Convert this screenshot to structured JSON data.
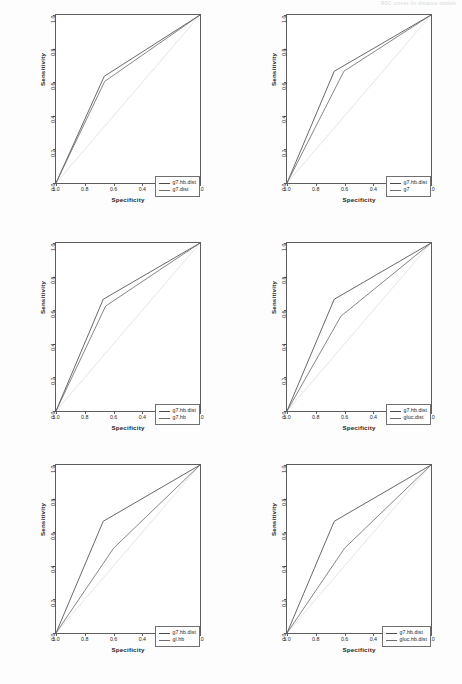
{
  "header": {
    "note": "ROC curves for distance models"
  },
  "axes": {
    "xlabel": "Specificity",
    "ylabel": "Sensitivity",
    "xticks": [
      "1.0",
      "0.8",
      "0.6",
      "0.4",
      "0.2",
      "0.0"
    ],
    "yticks": [
      "0.0",
      "0.2",
      "0.4",
      "0.6",
      "0.8",
      "1.0"
    ]
  },
  "colors": {
    "series_primary": "#4a4a4a",
    "series_secondary": "#6e6e6e",
    "diagonal": "#e2e2e2",
    "axis": "#5d5d5d",
    "legend_border": "#707070",
    "background": "#ffffff"
  },
  "chart_data": [
    {
      "type": "line",
      "panel": "top-left",
      "title": "",
      "xlabel": "Specificity",
      "ylabel": "Sensitivity",
      "xlim": [
        1.0,
        0.0
      ],
      "ylim": [
        0.0,
        1.0
      ],
      "x_reversed": true,
      "grid": false,
      "legend_position": "bottom-right",
      "diagonal_reference": true,
      "series": [
        {
          "name": "g7.hb.dist",
          "points": [
            [
              1.0,
              0.0
            ],
            [
              0.665,
              0.635
            ],
            [
              0.0,
              1.0
            ]
          ]
        },
        {
          "name": "g7.dist",
          "points": [
            [
              1.0,
              0.0
            ],
            [
              0.662,
              0.605
            ],
            [
              0.0,
              1.0
            ]
          ]
        }
      ]
    },
    {
      "type": "line",
      "panel": "top-right",
      "title": "",
      "xlabel": "Specificity",
      "ylabel": "Sensitivity",
      "xlim": [
        1.0,
        0.0
      ],
      "ylim": [
        0.0,
        1.0
      ],
      "x_reversed": true,
      "grid": false,
      "legend_position": "bottom-right",
      "diagonal_reference": true,
      "series": [
        {
          "name": "g7.hb.dist",
          "points": [
            [
              1.0,
              0.0
            ],
            [
              0.672,
              0.665
            ],
            [
              0.0,
              1.0
            ]
          ]
        },
        {
          "name": "g7",
          "points": [
            [
              1.0,
              0.0
            ],
            [
              0.605,
              0.665
            ],
            [
              0.0,
              1.0
            ]
          ]
        }
      ]
    },
    {
      "type": "line",
      "panel": "middle-left",
      "title": "",
      "xlabel": "Specificity",
      "ylabel": "Sensitivity",
      "xlim": [
        1.0,
        0.0
      ],
      "ylim": [
        0.0,
        1.0
      ],
      "x_reversed": true,
      "grid": false,
      "legend_position": "bottom-right",
      "diagonal_reference": true,
      "series": [
        {
          "name": "g7.hb.dist",
          "points": [
            [
              1.0,
              0.0
            ],
            [
              0.672,
              0.665
            ],
            [
              0.0,
              1.0
            ]
          ]
        },
        {
          "name": "g7.hb",
          "points": [
            [
              1.0,
              0.0
            ],
            [
              0.655,
              0.625
            ],
            [
              0.0,
              1.0
            ]
          ]
        }
      ]
    },
    {
      "type": "line",
      "panel": "middle-right",
      "title": "",
      "xlabel": "Specificity",
      "ylabel": "Sensitivity",
      "xlim": [
        1.0,
        0.0
      ],
      "ylim": [
        0.0,
        1.0
      ],
      "x_reversed": true,
      "grid": false,
      "legend_position": "bottom-right",
      "diagonal_reference": true,
      "series": [
        {
          "name": "g7.hb.dist",
          "points": [
            [
              1.0,
              0.0
            ],
            [
              0.672,
              0.665
            ],
            [
              0.0,
              1.0
            ]
          ]
        },
        {
          "name": "gluc.dist",
          "points": [
            [
              1.0,
              0.0
            ],
            [
              0.625,
              0.565
            ],
            [
              0.0,
              1.0
            ]
          ]
        }
      ]
    },
    {
      "type": "line",
      "panel": "bottom-left",
      "title": "",
      "xlabel": "Specificity",
      "ylabel": "Sensitivity",
      "xlim": [
        1.0,
        0.0
      ],
      "ylim": [
        0.0,
        1.0
      ],
      "x_reversed": true,
      "grid": false,
      "legend_position": "bottom-right",
      "diagonal_reference": true,
      "series": [
        {
          "name": "g7.hb.dist",
          "points": [
            [
              1.0,
              0.0
            ],
            [
              0.672,
              0.665
            ],
            [
              0.0,
              1.0
            ]
          ]
        },
        {
          "name": "gl.hb",
          "points": [
            [
              1.0,
              0.0
            ],
            [
              0.6,
              0.505
            ],
            [
              0.0,
              1.0
            ]
          ]
        }
      ]
    },
    {
      "type": "line",
      "panel": "bottom-right",
      "title": "",
      "xlabel": "Specificity",
      "ylabel": "Sensitivity",
      "xlim": [
        1.0,
        0.0
      ],
      "ylim": [
        0.0,
        1.0
      ],
      "x_reversed": true,
      "grid": false,
      "legend_position": "bottom-right",
      "diagonal_reference": true,
      "series": [
        {
          "name": "g7.hb.dist",
          "points": [
            [
              1.0,
              0.0
            ],
            [
              0.672,
              0.665
            ],
            [
              0.0,
              1.0
            ]
          ]
        },
        {
          "name": "gluc.hb.dist",
          "points": [
            [
              1.0,
              0.0
            ],
            [
              0.6,
              0.505
            ],
            [
              0.0,
              1.0
            ]
          ]
        }
      ]
    }
  ]
}
